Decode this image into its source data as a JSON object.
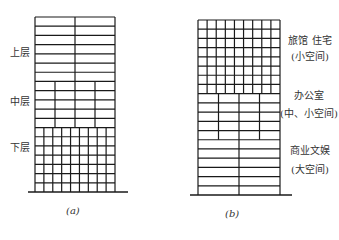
{
  "figure": {
    "a": {
      "caption": "(a)",
      "labels": {
        "upper": "上层",
        "middle": "中层",
        "lower": "下层"
      },
      "grid": {
        "left": 35,
        "right": 115,
        "top": 17,
        "ground": 192,
        "ground_line": [
          28,
          128
        ],
        "upper_zone": {
          "rows": 7,
          "columns": 2
        },
        "middle_zone": {
          "rows": 5,
          "columns": 4
        },
        "lower_zone": {
          "rows": 7,
          "columns": 9
        }
      }
    },
    "b": {
      "caption": "(b)",
      "labels": {
        "top_line1": "旅馆 住宅",
        "top_line2": "(小空间)",
        "mid_line1": "办公室",
        "mid_line2": "(中、小空间)",
        "bot_line1": "商业文娱",
        "bot_line2": "(大空间)"
      },
      "grid": {
        "left": 198,
        "right": 280,
        "top": 20,
        "ground": 195,
        "ground_line": [
          190,
          292
        ],
        "top_zone": {
          "rows": 8,
          "columns": 9
        },
        "middle_zone": {
          "rows": 5,
          "columns": 4
        },
        "bottom_zone": {
          "rows": 6,
          "columns": 2
        }
      }
    }
  },
  "colors": {
    "line": "#1a1a1a",
    "background": "#ffffff",
    "text": "#333333"
  }
}
